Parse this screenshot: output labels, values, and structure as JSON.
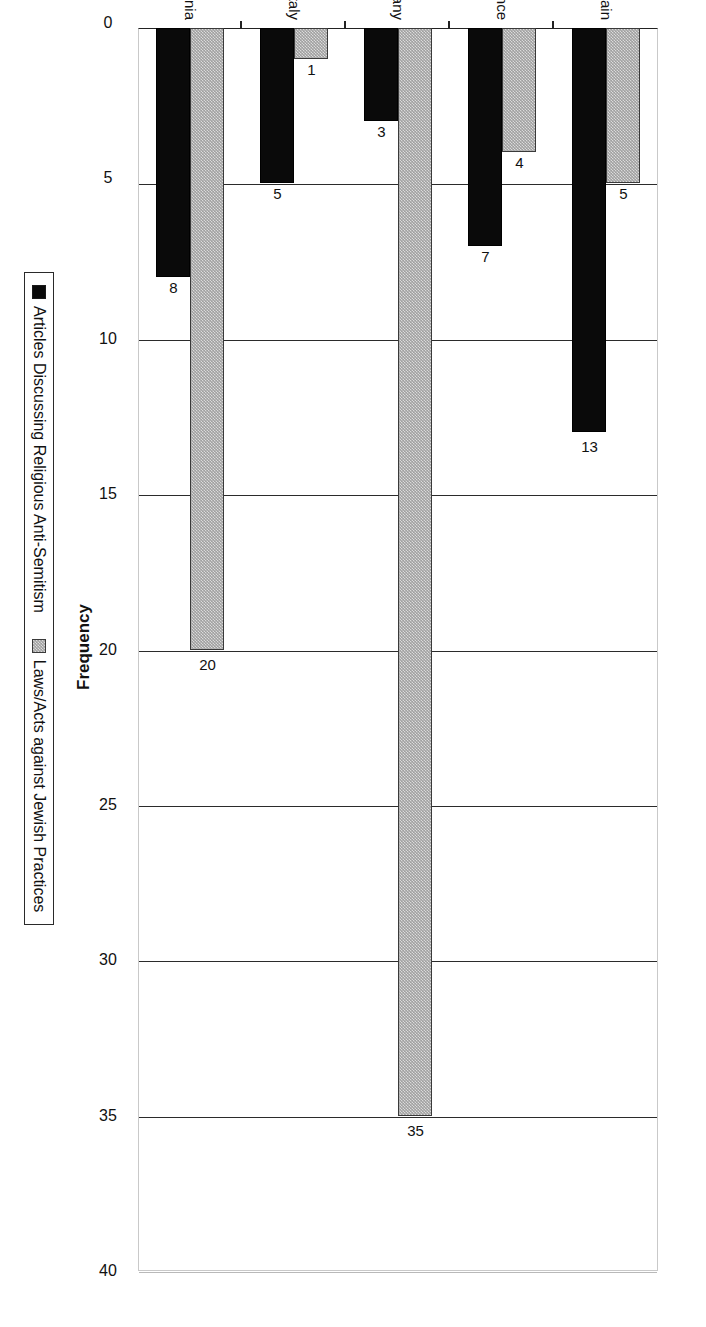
{
  "chart_data": {
    "type": "bar",
    "orientation": "vertical-rendered-rotated",
    "title": "",
    "xlabel": "Country",
    "ylabel": "Frequency",
    "ylim": [
      0,
      40
    ],
    "ytick_step": 5,
    "ytick_labels": [
      "0",
      "5",
      "10",
      "15",
      "20",
      "25",
      "30",
      "35",
      "40"
    ],
    "grid": true,
    "legend_position": "bottom",
    "categories": [
      "Great Britain",
      "France",
      "Germany",
      "Italy",
      "Romania"
    ],
    "series": [
      {
        "name": "Articles Discussing Religious Anti-Semitism",
        "color": "#0a0a0a",
        "swatch": "black",
        "values": [
          13,
          7,
          3,
          5,
          8
        ],
        "labels": [
          "13",
          "7",
          "3",
          "5",
          "8"
        ]
      },
      {
        "name": "Laws/Acts against Jewish Practices",
        "color": "#a0a0a0",
        "swatch": "gray",
        "values": [
          5,
          4,
          35,
          1,
          20
        ],
        "labels": [
          "5",
          "4",
          "35",
          "1",
          "20"
        ]
      }
    ]
  },
  "axes": {
    "x_axis_title": "Country",
    "y_axis_title": "Frequency"
  },
  "legend": {
    "items": [
      {
        "label": "Articles Discussing Religious Anti-Semitism",
        "swatch": "black"
      },
      {
        "label": "Laws/Acts against Jewish Practices",
        "swatch": "gray"
      }
    ]
  }
}
